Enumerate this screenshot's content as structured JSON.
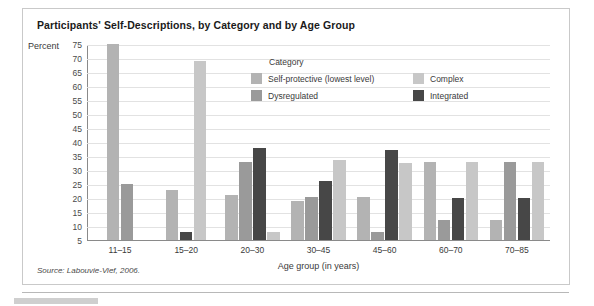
{
  "figure": {
    "title": "Participants' Self-Descriptions, by Category and by Age Group",
    "source": "Source: Labouvie-Vief, 2006."
  },
  "legend": {
    "title": "Category",
    "items": [
      {
        "label": "Self-protective (lowest level)",
        "color": "#b3b3b3"
      },
      {
        "label": "Complex",
        "color": "#c7c7c7"
      },
      {
        "label": "Dysregulated",
        "color": "#9a9a9a"
      },
      {
        "label": "Integrated",
        "color": "#474747"
      }
    ]
  },
  "chart_data": {
    "type": "bar",
    "title": "Participants' Self-Descriptions, by Category and by Age Group",
    "xlabel": "Age group (in years)",
    "ylabel": "Percent",
    "ylim": [
      5,
      75
    ],
    "ytick_step": 5,
    "yticks": [
      "75",
      "70",
      "65",
      "60",
      "55",
      "50",
      "45",
      "40",
      "35",
      "30",
      "25",
      "20",
      "15",
      "10",
      "5"
    ],
    "grid": true,
    "legend_position": "inside-top-center",
    "categories": [
      "11–15",
      "15–20",
      "20–30",
      "30–45",
      "45–60",
      "60–70",
      "70–85"
    ],
    "series": [
      {
        "name": "Self-protective (lowest level)",
        "color": "#b3b3b3",
        "values": [
          75,
          23,
          21,
          19,
          20.5,
          33,
          12
        ]
      },
      {
        "name": "Dysregulated",
        "color": "#9a9a9a",
        "values": [
          25,
          0,
          33,
          20.5,
          8,
          12,
          33
        ]
      },
      {
        "name": "Integrated",
        "color": "#474747",
        "values": [
          0,
          8,
          38,
          26,
          37,
          20,
          20
        ]
      },
      {
        "name": "Complex",
        "color": "#c7c7c7",
        "values": [
          0,
          69,
          8,
          33.5,
          32.5,
          33,
          33
        ]
      }
    ]
  }
}
